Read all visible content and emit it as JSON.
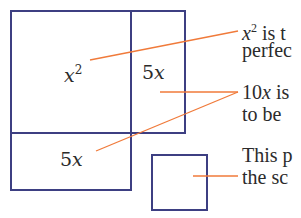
{
  "colors": {
    "box_stroke": "#3d3f82",
    "leader_line": "#f07a3a",
    "text": "#2b2b2b",
    "background": "#ffffff"
  },
  "diagram": {
    "labels": {
      "x_squared_var": "x",
      "x_squared_exp": "2",
      "five_x_right_num": "5",
      "five_x_right_var": "x",
      "five_x_bottom_num": "5",
      "five_x_bottom_var": "x"
    },
    "notes": [
      {
        "line1_var": "x",
        "line1_sup": "2",
        "line1_rest": " is t",
        "line2": "perfec"
      },
      {
        "line1_num": "10",
        "line1_var": "x",
        "line1_rest": " is",
        "line2": "to be"
      },
      {
        "line1": "This p",
        "line2": "the sc"
      }
    ]
  }
}
